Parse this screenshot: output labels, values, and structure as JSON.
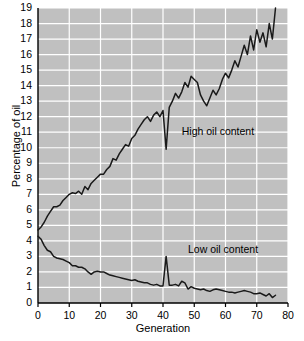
{
  "chart_data": {
    "type": "line",
    "title": "",
    "xlabel": "Generation",
    "ylabel": "Percentage of oil",
    "xlim": [
      0,
      80
    ],
    "ylim": [
      0,
      19
    ],
    "xticks": [
      0,
      10,
      20,
      30,
      40,
      50,
      60,
      70,
      80
    ],
    "yticks": [
      0,
      1,
      2,
      3,
      4,
      5,
      6,
      7,
      8,
      9,
      10,
      11,
      12,
      13,
      14,
      15,
      16,
      17,
      18,
      19
    ],
    "grid": true,
    "legend_position": "inline-annotation",
    "plot_background": "#c0c0c0",
    "gridline_color": "#ffffff",
    "line_color": "#1a1a1a",
    "annotations": [
      {
        "text": "High oil content",
        "x": 46,
        "y": 10.8
      },
      {
        "text": "Low oil content",
        "x": 48,
        "y": 3.2
      }
    ],
    "series": [
      {
        "name": "High oil content",
        "x": [
          0,
          1,
          2,
          3,
          4,
          5,
          6,
          7,
          8,
          9,
          10,
          11,
          12,
          13,
          14,
          15,
          16,
          17,
          18,
          19,
          20,
          21,
          22,
          23,
          24,
          25,
          26,
          27,
          28,
          29,
          30,
          31,
          32,
          33,
          34,
          35,
          36,
          37,
          38,
          39,
          40,
          41,
          42,
          43,
          44,
          45,
          46,
          47,
          48,
          49,
          50,
          51,
          52,
          53,
          54,
          55,
          56,
          57,
          58,
          59,
          60,
          61,
          62,
          63,
          64,
          65,
          66,
          67,
          68,
          69,
          70,
          71,
          72,
          73,
          74,
          75,
          76
        ],
        "values": [
          4.7,
          4.9,
          5.2,
          5.6,
          5.9,
          6.2,
          6.2,
          6.3,
          6.6,
          6.8,
          7.0,
          7.1,
          7.05,
          7.2,
          7.0,
          7.5,
          7.3,
          7.7,
          7.9,
          8.1,
          8.3,
          8.3,
          8.6,
          8.8,
          9.3,
          9.2,
          9.6,
          9.9,
          10.2,
          10.1,
          10.6,
          10.8,
          11.2,
          11.5,
          11.8,
          12.0,
          11.7,
          12.1,
          12.3,
          12.0,
          12.4,
          9.9,
          12.6,
          13.0,
          13.5,
          13.2,
          13.6,
          14.2,
          13.9,
          14.6,
          14.4,
          14.2,
          13.4,
          13.0,
          12.7,
          13.2,
          13.7,
          13.4,
          13.8,
          14.4,
          14.8,
          14.5,
          15.0,
          15.6,
          15.2,
          15.9,
          16.6,
          16.0,
          17.2,
          16.3,
          17.6,
          16.8,
          17.4,
          16.5,
          18.0,
          17.0,
          19.0
        ]
      },
      {
        "name": "Low oil content",
        "x": [
          0,
          1,
          2,
          3,
          4,
          5,
          6,
          7,
          8,
          9,
          10,
          11,
          12,
          13,
          14,
          15,
          16,
          17,
          18,
          19,
          20,
          21,
          22,
          23,
          24,
          25,
          26,
          27,
          28,
          29,
          30,
          31,
          32,
          33,
          34,
          35,
          36,
          37,
          38,
          39,
          40,
          41,
          42,
          43,
          44,
          45,
          46,
          47,
          48,
          49,
          50,
          51,
          52,
          53,
          54,
          55,
          56,
          57,
          58,
          59,
          60,
          61,
          62,
          63,
          64,
          65,
          66,
          67,
          68,
          69,
          70,
          71,
          72,
          73,
          74,
          75,
          76
        ],
        "values": [
          4.3,
          4.1,
          3.7,
          3.4,
          3.3,
          3.0,
          2.9,
          2.85,
          2.8,
          2.7,
          2.6,
          2.4,
          2.4,
          2.3,
          2.3,
          2.2,
          2.0,
          1.85,
          2.0,
          2.05,
          2.0,
          2.0,
          1.9,
          1.8,
          1.75,
          1.7,
          1.65,
          1.6,
          1.55,
          1.5,
          1.45,
          1.5,
          1.4,
          1.35,
          1.3,
          1.3,
          1.2,
          1.15,
          1.2,
          1.1,
          1.1,
          3.0,
          1.15,
          1.15,
          1.2,
          1.1,
          1.4,
          1.3,
          0.9,
          1.05,
          0.95,
          0.9,
          0.85,
          0.9,
          0.8,
          0.75,
          0.85,
          0.9,
          0.85,
          0.8,
          0.75,
          0.7,
          0.7,
          0.65,
          0.7,
          0.75,
          0.8,
          0.75,
          0.7,
          0.6,
          0.6,
          0.65,
          0.55,
          0.45,
          0.6,
          0.35,
          0.5
        ]
      }
    ]
  },
  "axis": {
    "ylabel": "Percentage of oil",
    "xlabel": "Generation"
  },
  "labels": {
    "high": "High oil content",
    "low": "Low oil content"
  }
}
